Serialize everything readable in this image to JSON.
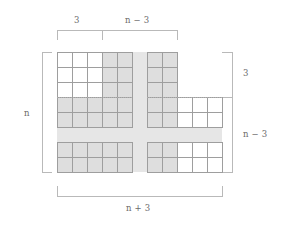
{
  "figure": {
    "title": "",
    "labels": {
      "top_left": "3",
      "top_right": "n − 3",
      "left": "n",
      "right_top": "3",
      "right_bottom": "n − 3",
      "bottom": "n + 3"
    },
    "colors": {
      "shaded_cell": "#dedede",
      "band": "#e6e6e6",
      "cell_border": "#9e9e9e",
      "brace": "#b9b9b9",
      "text": "#6b6b6b",
      "background": "#ffffff"
    }
  },
  "chart_data": {
    "type": "diagram-grid",
    "cell_size_px": 15,
    "geometry": {
      "left_block_x": 57,
      "right_block_x": 147,
      "top_block_y": 52,
      "bottom_block_y": 142,
      "gap_px": 15
    },
    "blocks": [
      {
        "name": "top-left",
        "cols": 5,
        "rows": 5,
        "shaded_cells": [
          [
            0,
            3
          ],
          [
            0,
            4
          ],
          [
            1,
            3
          ],
          [
            1,
            4
          ],
          [
            2,
            3
          ],
          [
            2,
            4
          ],
          [
            3,
            0
          ],
          [
            3,
            1
          ],
          [
            3,
            2
          ],
          [
            3,
            3
          ],
          [
            3,
            4
          ],
          [
            4,
            0
          ],
          [
            4,
            1
          ],
          [
            4,
            2
          ],
          [
            4,
            3
          ],
          [
            4,
            4
          ]
        ]
      },
      {
        "name": "top-right",
        "cols": 2,
        "rows": 5,
        "shaded_cells": [
          [
            0,
            0
          ],
          [
            0,
            1
          ],
          [
            1,
            0
          ],
          [
            1,
            1
          ],
          [
            2,
            0
          ],
          [
            2,
            1
          ],
          [
            3,
            0
          ],
          [
            3,
            1
          ],
          [
            4,
            0
          ],
          [
            4,
            1
          ]
        ]
      },
      {
        "name": "top-right-tail",
        "cols": 3,
        "rows": 2,
        "shaded_cells": []
      },
      {
        "name": "bottom-left",
        "cols": 5,
        "rows": 2,
        "shaded_cells": [
          [
            0,
            0
          ],
          [
            0,
            1
          ],
          [
            0,
            2
          ],
          [
            0,
            3
          ],
          [
            0,
            4
          ],
          [
            1,
            0
          ],
          [
            1,
            1
          ],
          [
            1,
            2
          ],
          [
            1,
            3
          ],
          [
            1,
            4
          ]
        ]
      },
      {
        "name": "bottom-right",
        "cols": 5,
        "rows": 2,
        "shaded_cells": [
          [
            0,
            0
          ],
          [
            0,
            1
          ],
          [
            1,
            0
          ],
          [
            1,
            1
          ]
        ]
      }
    ],
    "braces": [
      {
        "name": "top-left-brace",
        "label": "3",
        "orientation": "horizontal",
        "from_px": 57,
        "to_px": 102
      },
      {
        "name": "top-right-brace",
        "label": "n − 3",
        "orientation": "horizontal",
        "from_px": 102,
        "to_px": 177
      },
      {
        "name": "left-brace",
        "label": "n",
        "orientation": "vertical",
        "from_px": 52,
        "to_px": 172
      },
      {
        "name": "right-top-brace",
        "label": "3",
        "orientation": "vertical",
        "from_px": 52,
        "to_px": 97
      },
      {
        "name": "right-bottom-brace",
        "label": "n − 3",
        "orientation": "vertical",
        "from_px": 97,
        "to_px": 172
      },
      {
        "name": "bottom-brace",
        "label": "n + 3",
        "orientation": "horizontal",
        "from_px": 57,
        "to_px": 222
      }
    ],
    "annotations": [
      {
        "name": "dotted-row-separator",
        "y_px": 97,
        "spans": [
          [
            57,
            132
          ],
          [
            147,
            222
          ]
        ]
      }
    ]
  }
}
